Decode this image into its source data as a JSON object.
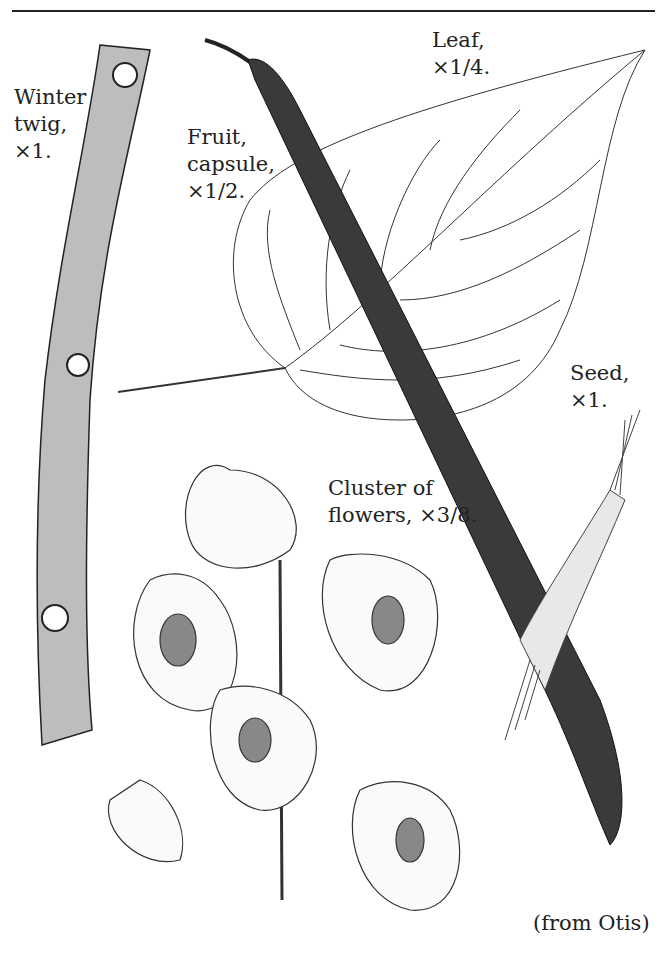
{
  "figure": {
    "labels": {
      "winter_twig": [
        "Winter",
        "twig,",
        "×1."
      ],
      "fruit": [
        "Fruit,",
        "capsule,",
        "×1/2."
      ],
      "leaf": [
        "Leaf,",
        "×1/4."
      ],
      "seed": [
        "Seed,",
        "×1."
      ],
      "flowers": [
        "Cluster of",
        "flowers, ×3/8."
      ]
    },
    "credit": "(from Otis)"
  }
}
